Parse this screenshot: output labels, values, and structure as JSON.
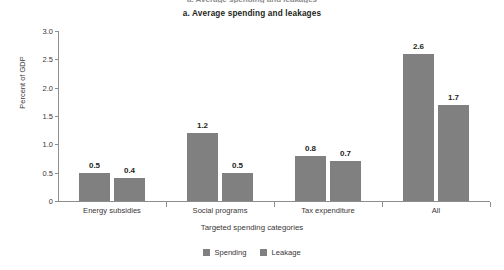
{
  "figure": {
    "top_cropped_text": "a. Average spending and leakages",
    "panel_title": "a. Average spending and leakages"
  },
  "chart_data": {
    "type": "bar",
    "title": "a. Average spending and leakages",
    "xlabel": "Targeted spending categories",
    "ylabel": "Percent of GDP",
    "categories": [
      "Energy subsidies",
      "Social programs",
      "Tax expenditure",
      "All"
    ],
    "series": [
      {
        "name": "Spending",
        "values": [
          0.5,
          1.2,
          0.8,
          2.6
        ],
        "color": "#808080"
      },
      {
        "name": "Leakage",
        "values": [
          0.4,
          0.5,
          0.7,
          1.7
        ],
        "color": "#808080"
      }
    ],
    "ylim": [
      0,
      3.0
    ],
    "yticks": [
      "0",
      "0.5",
      "1.0",
      "1.5",
      "2.0",
      "2.5",
      "3.0"
    ],
    "ytick_values": [
      0,
      0.5,
      1.0,
      1.5,
      2.0,
      2.5,
      3.0
    ],
    "grid": false,
    "legend_position": "bottom",
    "data_labels": [
      [
        "0.5",
        "0.4"
      ],
      [
        "1.2",
        "0.5"
      ],
      [
        "0.8",
        "0.7"
      ],
      [
        "2.6",
        "1.7"
      ]
    ]
  }
}
